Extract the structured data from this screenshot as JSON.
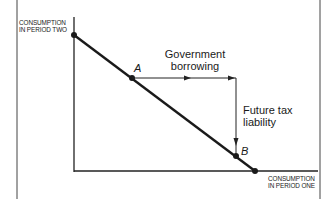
{
  "diagram": {
    "y_axis_label": [
      "CONSUMPTION",
      "IN PERIOD TWO"
    ],
    "x_axis_label": [
      "CONSUMPTION",
      "IN PERIOD ONE"
    ],
    "points": {
      "a": "A",
      "b": "B"
    },
    "annotations": {
      "horizontal": [
        "Government",
        "borrowing"
      ],
      "vertical": [
        "Future tax",
        "liability"
      ]
    },
    "colors": {
      "line": "#1a1a1a",
      "background": "#ffffff"
    }
  }
}
